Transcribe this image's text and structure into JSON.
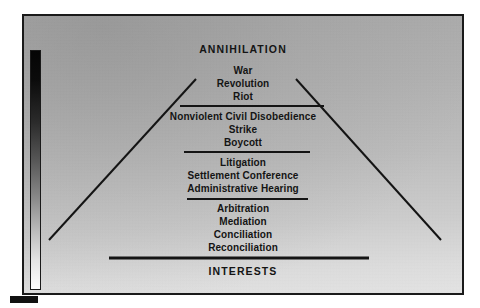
{
  "diagram": {
    "title_top": "ANNIHILATION",
    "title_bottom": "INTERESTS",
    "type": "conflict-escalation-pyramid",
    "colors": {
      "ink": "#141414",
      "frame": "#1a1a1a",
      "background_top": "#a9a9a9",
      "background_bottom": "#e3e3e3",
      "scale_high": "#050505",
      "scale_low": "#fdfdfd"
    },
    "scale": {
      "name": "escalation-gradient-bar",
      "high_end": "top",
      "low_end": "bottom"
    },
    "tiers": [
      {
        "id": "tier-top",
        "label": "ANNIHILATION",
        "items": [
          "ANNIHILATION"
        ]
      },
      {
        "id": "tier-1",
        "label": "Violent action",
        "items": [
          "War",
          "Revolution",
          "Riot"
        ]
      },
      {
        "id": "tier-2",
        "label": "Direct action",
        "items": [
          "Nonviolent Civil Disobedience",
          "Strike",
          "Boycott"
        ]
      },
      {
        "id": "tier-3",
        "label": "Adjudicative processes",
        "items": [
          "Litigation",
          "Settlement Conference",
          "Administrative Hearing"
        ]
      },
      {
        "id": "tier-4",
        "label": "Consensual processes",
        "items": [
          "Arbitration",
          "Mediation",
          "Conciliation",
          "Reconciliation"
        ]
      },
      {
        "id": "tier-bottom",
        "label": "INTERESTS",
        "items": [
          "INTERESTS"
        ]
      }
    ],
    "legend": {
      "swatch_name": "legend-swatch"
    }
  }
}
